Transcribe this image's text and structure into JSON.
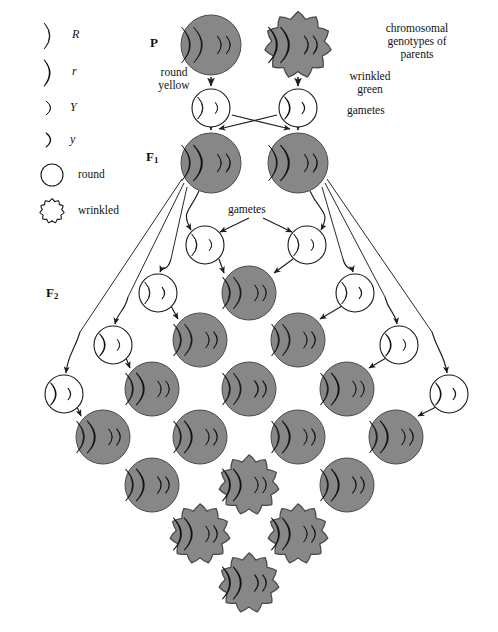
{
  "figure": {
    "type": "genetics-dihybrid-cross-diagram",
    "title_text": "chromosomal genotypes of parents",
    "generation_labels": {
      "p": "P",
      "f1_base": "F",
      "f1_sub": "1",
      "f2_base": "F",
      "f2_sub": "2"
    },
    "annotations": {
      "round_yellow": "round\nyellow",
      "wrinkled_green": "wrinkled\ngreen",
      "gametes_p": "gametes",
      "gametes_f1": "gametes"
    },
    "colors": {
      "cell_gray": "#878787",
      "cell_outline": "#4a4a4a",
      "gamete_fill": "#ffffff",
      "gamete_outline": "#1a1a1a",
      "allele_dominant": "#0d0d0d",
      "allele_recessive": "#ffffff",
      "allele_outline": "#111111",
      "arrow": "#1d1d1d",
      "background": "#ffffff"
    }
  },
  "legend": {
    "items": [
      {
        "symbol": "R",
        "shape": "long-rod",
        "fill": "black",
        "label": "R",
        "kind": "allele"
      },
      {
        "symbol": "r",
        "shape": "long-rod",
        "fill": "white",
        "label": "r",
        "kind": "allele"
      },
      {
        "symbol": "Y",
        "shape": "short-rod",
        "fill": "black",
        "label": "Y",
        "kind": "allele"
      },
      {
        "symbol": "y",
        "shape": "short-rod",
        "fill": "white",
        "label": "y",
        "kind": "allele"
      },
      {
        "symbol": "round",
        "shape": "circle",
        "fill": "white",
        "label": "round",
        "kind": "phenotype"
      },
      {
        "symbol": "wrinkled",
        "shape": "wrinkled",
        "fill": "white",
        "label": "wrinkled",
        "kind": "phenotype"
      }
    ]
  },
  "chart_data": {
    "type": "diagram",
    "cross": "RRYY x rryy -> F1 RrYy -> F2 9:3:3:1",
    "p_generation": [
      {
        "id": "p-left",
        "genotype": "RRYY",
        "phenotype": "round yellow",
        "shape": "round",
        "alleles": [
          "R",
          "R",
          "Y",
          "Y"
        ]
      },
      {
        "id": "p-right",
        "genotype": "rryy",
        "phenotype": "wrinkled green",
        "shape": "wrinkled",
        "alleles": [
          "r",
          "r",
          "y",
          "y"
        ]
      }
    ],
    "p_gametes": [
      {
        "id": "pg-left",
        "genotype": "RY",
        "shape": "round",
        "alleles": [
          "R",
          "Y"
        ]
      },
      {
        "id": "pg-right",
        "genotype": "ry",
        "shape": "round",
        "alleles": [
          "r",
          "y"
        ]
      }
    ],
    "f1_generation": [
      {
        "id": "f1-left",
        "genotype": "RrYy",
        "phenotype": "round yellow",
        "shape": "round",
        "alleles": [
          "R",
          "r",
          "Y",
          "y"
        ]
      },
      {
        "id": "f1-right",
        "genotype": "RrYy",
        "phenotype": "round yellow",
        "shape": "round",
        "alleles": [
          "R",
          "r",
          "Y",
          "y"
        ]
      }
    ],
    "f1_gametes_center": [
      {
        "id": "g-c-left",
        "genotype": "RY",
        "alleles": [
          "R",
          "Y"
        ]
      },
      {
        "id": "g-c-right",
        "genotype": "RY",
        "alleles": [
          "R",
          "Y"
        ]
      }
    ],
    "gamete_row_left": [
      {
        "id": "gl-1",
        "genotype": "Ry",
        "alleles": [
          "R",
          "y"
        ]
      },
      {
        "id": "gl-2",
        "genotype": "rY",
        "alleles": [
          "r",
          "Y"
        ]
      },
      {
        "id": "gl-3",
        "genotype": "ry",
        "alleles": [
          "r",
          "y"
        ]
      }
    ],
    "gamete_row_right": [
      {
        "id": "gr-1",
        "genotype": "Ry",
        "alleles": [
          "R",
          "y"
        ]
      },
      {
        "id": "gr-2",
        "genotype": "rY",
        "alleles": [
          "r",
          "Y"
        ]
      },
      {
        "id": "gr-3",
        "genotype": "ry",
        "alleles": [
          "r",
          "y"
        ]
      }
    ],
    "f2_grid": {
      "rows": 4,
      "cols": 4,
      "arrangement": "diamond",
      "cells": [
        {
          "r": 0,
          "c": 0,
          "genotype": "RRYY",
          "shape": "round",
          "alleles": [
            "R",
            "R",
            "Y",
            "Y"
          ]
        },
        {
          "r": 0,
          "c": 1,
          "genotype": "RRYy",
          "shape": "round",
          "alleles": [
            "R",
            "R",
            "Y",
            "y"
          ]
        },
        {
          "r": 0,
          "c": 2,
          "genotype": "RrYY",
          "shape": "round",
          "alleles": [
            "R",
            "r",
            "Y",
            "Y"
          ]
        },
        {
          "r": 0,
          "c": 3,
          "genotype": "RrYy",
          "shape": "round",
          "alleles": [
            "R",
            "r",
            "Y",
            "y"
          ]
        },
        {
          "r": 1,
          "c": 0,
          "genotype": "RRYy",
          "shape": "round",
          "alleles": [
            "R",
            "R",
            "Y",
            "y"
          ]
        },
        {
          "r": 1,
          "c": 1,
          "genotype": "RRyy",
          "shape": "round",
          "alleles": [
            "R",
            "R",
            "y",
            "y"
          ]
        },
        {
          "r": 1,
          "c": 2,
          "genotype": "RrYy",
          "shape": "round",
          "alleles": [
            "R",
            "r",
            "Y",
            "y"
          ]
        },
        {
          "r": 1,
          "c": 3,
          "genotype": "Rryy",
          "shape": "round",
          "alleles": [
            "R",
            "r",
            "y",
            "y"
          ]
        },
        {
          "r": 2,
          "c": 0,
          "genotype": "RrYY",
          "shape": "round",
          "alleles": [
            "R",
            "r",
            "Y",
            "Y"
          ]
        },
        {
          "r": 2,
          "c": 1,
          "genotype": "RrYy",
          "shape": "round",
          "alleles": [
            "R",
            "r",
            "Y",
            "y"
          ]
        },
        {
          "r": 2,
          "c": 2,
          "genotype": "rrYY",
          "shape": "wrinkled",
          "alleles": [
            "r",
            "r",
            "Y",
            "Y"
          ]
        },
        {
          "r": 2,
          "c": 3,
          "genotype": "rrYy",
          "shape": "wrinkled",
          "alleles": [
            "r",
            "r",
            "Y",
            "y"
          ]
        },
        {
          "r": 3,
          "c": 0,
          "genotype": "RrYy",
          "shape": "round",
          "alleles": [
            "R",
            "r",
            "Y",
            "y"
          ]
        },
        {
          "r": 3,
          "c": 1,
          "genotype": "Rryy",
          "shape": "round",
          "alleles": [
            "R",
            "r",
            "y",
            "y"
          ]
        },
        {
          "r": 3,
          "c": 2,
          "genotype": "rrYy",
          "shape": "wrinkled",
          "alleles": [
            "r",
            "r",
            "Y",
            "y"
          ]
        },
        {
          "r": 3,
          "c": 3,
          "genotype": "rryy",
          "shape": "wrinkled",
          "alleles": [
            "r",
            "r",
            "y",
            "y"
          ]
        }
      ]
    }
  }
}
